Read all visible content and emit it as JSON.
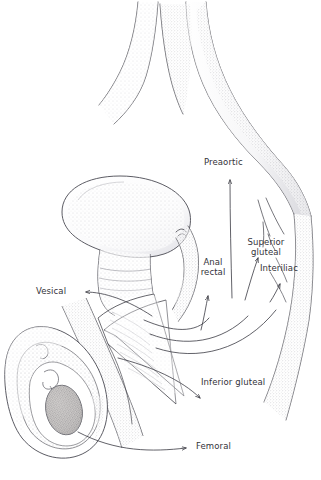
{
  "figure": {
    "background_color": "#ffffff",
    "ink_color": "#3a3a42",
    "label_color": "#33333a",
    "width": 321,
    "height": 480
  },
  "labels": {
    "preaortic": "Preaortic",
    "superior_gluteal": "Superior\ngluteal",
    "interiliac": "Interiliac",
    "anal_rectal": "Anal\nrectal",
    "vesical": "Vesical",
    "inferior_gluteal": "Inferior gluteal",
    "femoral": "Femoral"
  },
  "structures": [
    {
      "name": "aorta-bifurcation",
      "label": ""
    },
    {
      "name": "common-iliac-vessel",
      "label": ""
    },
    {
      "name": "bladder",
      "label": ""
    },
    {
      "name": "prostate",
      "label": ""
    },
    {
      "name": "penis-shaft",
      "label": ""
    },
    {
      "name": "testis",
      "label": ""
    },
    {
      "name": "scrotum",
      "label": ""
    }
  ]
}
